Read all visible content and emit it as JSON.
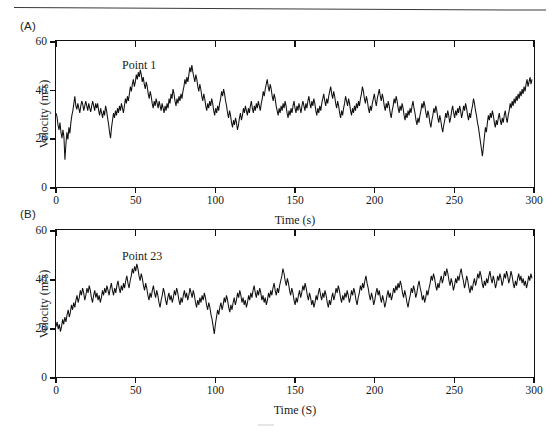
{
  "figure": {
    "panels": [
      {
        "letter": "(A)",
        "series_label": "Point 1",
        "xlabel": "Time (s)",
        "ylabel": "Velocity (m/s)",
        "xticks": [
          "0",
          "50",
          "100",
          "150",
          "200",
          "250",
          "300"
        ],
        "yticks": [
          "0",
          "20",
          "40",
          "60"
        ]
      },
      {
        "letter": "(B)",
        "series_label": "Point 23",
        "xlabel": "Time (S)",
        "ylabel": "Velocity (m/s)",
        "xticks": [
          "0",
          "50",
          "100",
          "150",
          "200",
          "250",
          "300"
        ],
        "yticks": [
          "0",
          "20",
          "40",
          "60"
        ]
      }
    ]
  },
  "chart_data": [
    {
      "type": "line",
      "title": "Point 1",
      "panel": "(A)",
      "xlabel": "Time (s)",
      "ylabel": "Velocity (m/s)",
      "xlim": [
        0,
        300
      ],
      "ylim": [
        0,
        60
      ],
      "xticks": [
        0,
        50,
        100,
        150,
        200,
        250,
        300
      ],
      "yticks": [
        0,
        20,
        40,
        60
      ],
      "grid": false,
      "legend": false,
      "series": [
        {
          "name": "Point 1",
          "color": "#111111",
          "x_step": 1.0,
          "values": [
            30,
            28.5,
            25,
            23,
            26,
            22,
            19.5,
            23,
            20,
            10.5,
            17,
            22,
            19,
            24,
            21.5,
            26,
            29,
            31,
            34,
            37,
            33,
            31.5,
            34,
            32,
            30,
            33,
            35,
            33.5,
            31,
            33,
            35,
            33,
            31,
            34,
            32,
            30.5,
            33,
            35,
            33,
            31,
            34,
            32,
            34,
            31,
            29,
            32,
            30,
            28,
            31,
            29,
            33,
            31,
            28,
            25.5,
            22,
            19.5,
            24,
            27,
            30,
            28,
            31,
            29,
            32,
            30,
            33,
            31,
            34,
            32,
            30,
            33,
            36,
            34,
            37,
            35,
            38,
            41,
            39,
            42,
            44,
            41,
            43,
            46,
            44,
            47,
            45,
            48,
            46,
            43,
            45,
            42,
            40,
            43,
            41,
            38,
            36,
            39,
            37,
            34,
            32,
            35,
            33,
            36,
            34,
            32,
            35,
            33,
            31,
            34,
            32,
            30,
            33,
            31,
            34,
            32,
            36,
            34,
            38,
            36,
            40,
            38,
            35,
            33,
            36,
            34,
            37,
            35,
            38,
            36,
            39,
            41,
            44,
            42,
            45,
            43,
            46,
            49,
            47,
            50,
            47,
            45,
            43,
            46,
            44,
            41,
            39,
            42,
            40,
            37,
            35,
            38,
            36,
            33,
            31,
            34,
            32,
            35,
            33,
            36,
            34,
            31,
            29,
            32,
            30,
            33,
            31,
            34,
            36,
            39,
            37,
            40,
            38,
            35,
            33,
            30,
            28,
            31,
            29,
            26,
            24,
            27,
            25,
            28,
            26,
            23,
            25,
            28,
            30,
            27,
            29,
            32,
            30,
            33,
            31,
            29,
            32,
            30,
            33,
            35,
            32,
            30,
            33,
            31,
            34,
            32,
            35,
            33,
            31,
            34,
            36,
            39,
            37,
            40,
            42,
            44,
            41,
            39,
            42,
            40,
            37,
            35,
            38,
            36,
            33,
            31,
            29,
            32,
            30,
            33,
            31,
            34,
            32,
            35,
            33,
            30,
            28,
            31,
            29,
            32,
            30,
            33,
            35,
            32,
            30,
            33,
            31,
            34,
            32,
            30,
            33,
            35,
            33,
            31,
            34,
            32,
            35,
            37,
            34,
            32,
            35,
            33,
            36,
            34,
            31,
            29,
            32,
            30,
            33,
            31,
            34,
            36,
            38,
            35,
            33,
            36,
            34,
            37,
            39,
            41,
            38,
            36,
            39,
            37,
            34,
            32,
            35,
            33,
            30,
            28,
            31,
            29,
            32,
            34,
            37,
            35,
            33,
            36,
            34,
            31,
            29,
            32,
            30,
            33,
            31,
            34,
            32,
            35,
            33,
            36,
            38,
            41,
            39,
            36,
            34,
            37,
            35,
            32,
            30,
            33,
            31,
            34,
            36,
            38,
            35,
            33,
            36,
            38,
            40,
            37,
            35,
            38,
            36,
            33,
            31,
            34,
            32,
            35,
            33,
            30,
            28,
            31,
            33,
            36,
            34,
            37,
            35,
            32,
            30,
            33,
            31,
            34,
            32,
            29,
            27,
            30,
            28,
            31,
            29,
            32,
            30,
            33,
            35,
            32,
            30,
            27,
            25,
            28,
            26,
            29,
            31,
            34,
            32,
            35,
            33,
            30,
            28,
            31,
            29,
            26,
            24,
            27,
            29,
            32,
            30,
            33,
            31,
            28,
            26,
            29,
            27,
            24,
            22,
            25,
            27,
            30,
            28,
            31,
            29,
            26,
            28,
            31,
            33,
            30,
            28,
            31,
            29,
            32,
            30,
            33,
            31,
            28,
            30,
            33,
            31,
            34,
            32,
            29,
            27,
            30,
            28,
            31,
            33,
            36,
            34,
            31,
            29,
            26,
            24,
            21,
            18,
            15,
            12,
            16,
            20,
            24,
            22,
            26,
            29,
            27,
            30,
            28,
            31,
            29,
            26,
            24,
            27,
            25,
            28,
            30,
            27,
            25,
            28,
            26,
            29,
            31,
            28,
            26,
            29,
            31,
            34,
            32,
            35,
            33,
            36,
            34,
            37,
            35,
            38,
            36,
            39,
            37,
            40,
            38,
            41,
            39,
            42,
            44,
            41,
            43,
            45,
            42,
            44
          ]
        }
      ]
    },
    {
      "type": "line",
      "title": "Point 23",
      "panel": "(B)",
      "xlabel": "Time (S)",
      "ylabel": "Velocity (m/s)",
      "xlim": [
        0,
        300
      ],
      "ylim": [
        0,
        60
      ],
      "xticks": [
        0,
        50,
        100,
        150,
        200,
        250,
        300
      ],
      "yticks": [
        0,
        20,
        40,
        60
      ],
      "grid": false,
      "legend": false,
      "series": [
        {
          "name": "Point 23",
          "color": "#111111",
          "x_step": 1.0,
          "values": [
            20,
            22,
            19,
            21,
            18,
            20,
            23,
            21,
            24,
            22,
            25,
            27,
            24,
            26,
            29,
            27,
            30,
            28,
            31,
            33,
            30,
            32,
            35,
            33,
            36,
            34,
            31,
            33,
            36,
            34,
            37,
            35,
            32,
            30,
            33,
            35,
            32,
            34,
            31,
            33,
            30,
            32,
            35,
            33,
            36,
            34,
            37,
            35,
            33,
            36,
            38,
            35,
            33,
            36,
            34,
            37,
            39,
            36,
            34,
            37,
            35,
            38,
            36,
            39,
            41,
            38,
            36,
            39,
            41,
            44,
            42,
            45,
            43,
            46,
            44,
            41,
            39,
            42,
            40,
            37,
            35,
            38,
            36,
            33,
            31,
            34,
            32,
            35,
            37,
            34,
            32,
            35,
            33,
            30,
            28,
            31,
            33,
            36,
            34,
            31,
            29,
            32,
            34,
            31,
            33,
            30,
            32,
            35,
            33,
            36,
            34,
            31,
            29,
            32,
            30,
            33,
            35,
            32,
            34,
            31,
            33,
            36,
            34,
            32,
            35,
            33,
            30,
            28,
            31,
            29,
            32,
            30,
            33,
            31,
            34,
            32,
            29,
            27,
            30,
            28,
            25,
            23,
            20,
            17,
            21,
            24,
            27,
            25,
            28,
            30,
            27,
            29,
            32,
            30,
            33,
            31,
            28,
            26,
            29,
            27,
            30,
            32,
            29,
            31,
            34,
            32,
            35,
            33,
            30,
            32,
            29,
            31,
            28,
            30,
            33,
            31,
            34,
            32,
            35,
            37,
            34,
            32,
            35,
            33,
            36,
            34,
            31,
            33,
            30,
            32,
            29,
            31,
            34,
            32,
            35,
            33,
            36,
            38,
            35,
            33,
            36,
            34,
            37,
            39,
            41,
            44,
            42,
            39,
            37,
            40,
            38,
            35,
            33,
            36,
            34,
            31,
            29,
            32,
            30,
            33,
            35,
            32,
            34,
            37,
            35,
            38,
            36,
            33,
            31,
            34,
            32,
            29,
            31,
            28,
            30,
            33,
            31,
            34,
            36,
            33,
            31,
            34,
            32,
            35,
            33,
            30,
            28,
            31,
            29,
            32,
            34,
            31,
            33,
            36,
            34,
            37,
            35,
            32,
            30,
            33,
            31,
            34,
            32,
            35,
            33,
            30,
            32,
            35,
            33,
            36,
            34,
            31,
            29,
            32,
            34,
            37,
            35,
            38,
            36,
            39,
            41,
            38,
            36,
            33,
            31,
            34,
            32,
            29,
            31,
            34,
            36,
            33,
            35,
            32,
            30,
            33,
            31,
            28,
            30,
            33,
            35,
            32,
            34,
            31,
            33,
            36,
            34,
            37,
            35,
            38,
            36,
            39,
            37,
            34,
            32,
            35,
            33,
            30,
            28,
            31,
            33,
            36,
            34,
            37,
            35,
            32,
            34,
            37,
            39,
            36,
            34,
            31,
            33,
            30,
            32,
            35,
            33,
            36,
            38,
            41,
            39,
            42,
            40,
            37,
            35,
            38,
            36,
            39,
            41,
            38,
            40,
            43,
            41,
            44,
            42,
            39,
            37,
            40,
            38,
            35,
            37,
            40,
            38,
            41,
            39,
            42,
            44,
            41,
            39,
            36,
            38,
            41,
            39,
            36,
            34,
            37,
            35,
            38,
            40,
            37,
            39,
            42,
            40,
            43,
            41,
            38,
            36,
            39,
            37,
            40,
            38,
            41,
            43,
            40,
            38,
            41,
            39,
            36,
            38,
            41,
            39,
            42,
            40,
            37,
            39,
            42,
            40,
            43,
            41,
            38,
            40,
            43,
            41,
            38,
            36,
            39,
            37,
            40,
            42,
            39,
            41,
            38,
            40,
            37,
            39,
            36,
            38,
            41,
            39,
            42,
            40
          ]
        }
      ]
    }
  ]
}
